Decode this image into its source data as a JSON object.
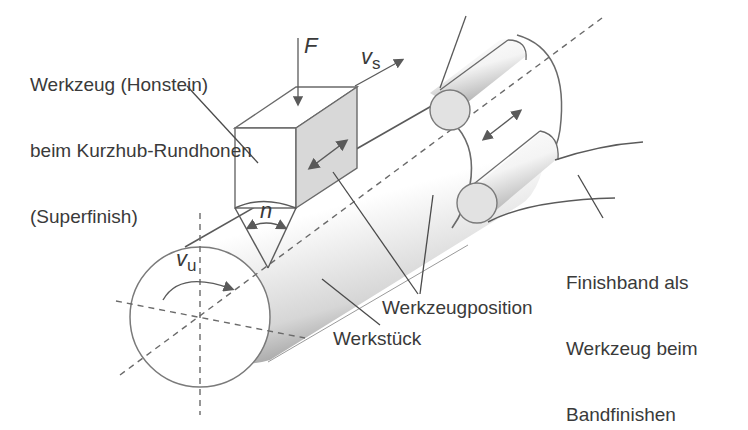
{
  "diagram": {
    "labels": {
      "tool_honstein_line1": "Werkzeug (Honstein)",
      "tool_honstein_line2": "beim Kurzhub-Rundhonen",
      "tool_honstein_line3": "(Superfinish)",
      "finishband_line1": "Finishband als",
      "finishband_line2": "Werkzeug beim",
      "finishband_line3": "Bandfinishen",
      "werkzeugposition": "Werkzeugposition",
      "werkstueck": "Werkstück"
    },
    "symbols": {
      "force": "F",
      "stroke_velocity": "v",
      "stroke_velocity_sub": "s",
      "circumferential_velocity": "v",
      "circumferential_velocity_sub": "u",
      "angle": "n"
    },
    "colors": {
      "line": "#5a5a5a",
      "text": "#3a3a3a",
      "shaded_face": "#d8d8d8",
      "roller_face": "#e2e2e2",
      "background": "#ffffff"
    }
  }
}
